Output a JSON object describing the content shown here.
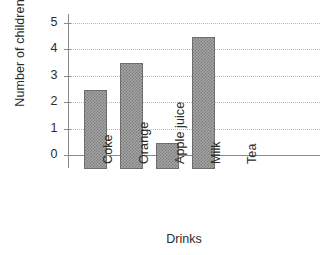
{
  "chart_data": {
    "type": "bar",
    "title": "",
    "xlabel": "Drinks",
    "ylabel": "Number of children",
    "categories": [
      "Coke",
      "Orange",
      "Apple juice",
      "Milk",
      "Tea"
    ],
    "values": [
      3,
      4,
      1,
      5,
      0
    ],
    "ytick_labels": [
      "0",
      "1",
      "2",
      "3",
      "4",
      "5"
    ],
    "yticks": [
      0,
      1,
      2,
      3,
      4,
      5
    ],
    "ylim": [
      0,
      5
    ],
    "grid": true,
    "grid_axis": "y",
    "legend": "none",
    "bar_fill": "#a3a3a3",
    "bar_pattern": "checkerboard-halftone",
    "bar_edge_color": "#6e6e6e",
    "axis_color": "#8a8a8a",
    "grid_color": "#b9b9b9",
    "text_color": "#2b2b2b",
    "background": "#ffffff"
  }
}
